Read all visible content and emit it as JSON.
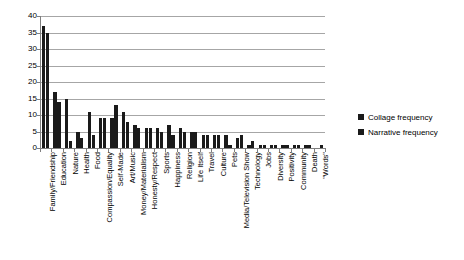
{
  "chart_data": {
    "type": "bar",
    "title": "",
    "subtitle": "",
    "xlabel": "",
    "ylabel": "",
    "ylim": [
      0,
      40
    ],
    "ytick_step": 5,
    "yticks": [
      "40",
      "35",
      "30",
      "25",
      "20",
      "15",
      "10",
      "5",
      "0"
    ],
    "grid": true,
    "legend_position": "right",
    "orientation": "vertical-grouped",
    "xlabel_rotation": -90,
    "categories": [
      "Family/Friendship",
      "Education",
      "Nature",
      "Health",
      "Food",
      "Compassion/Equality",
      "Self-Made",
      "Art/Music",
      "Money/Materialism",
      "Honesty/Respect",
      "Sports",
      "Happiness",
      "Religion",
      "Life Itself",
      "Travel",
      "Culture",
      "Pets",
      "Media/Television Show",
      "Technology",
      "Jobs",
      "Diversity",
      "Positivity",
      "Community",
      "Death",
      "\"Words\""
    ],
    "series": [
      {
        "name": "Collage frequency",
        "color": "#1a1a1a",
        "values": [
          37,
          17,
          15,
          5,
          11,
          9,
          9,
          11,
          7,
          6,
          6,
          7,
          6,
          5,
          4,
          4,
          4,
          3,
          1,
          1,
          1,
          1,
          1,
          1,
          0
        ]
      },
      {
        "name": "Narrative frequency",
        "color": "#1a1a1a",
        "values": [
          35,
          14,
          2,
          3,
          4,
          9,
          13,
          8,
          6,
          6,
          5,
          4,
          5,
          5,
          4,
          4,
          1,
          4,
          2,
          1,
          1,
          1,
          1,
          1,
          1
        ]
      }
    ]
  },
  "legend": {
    "entries": [
      {
        "label": "Collage frequency"
      },
      {
        "label": "Narrative frequency"
      }
    ]
  }
}
